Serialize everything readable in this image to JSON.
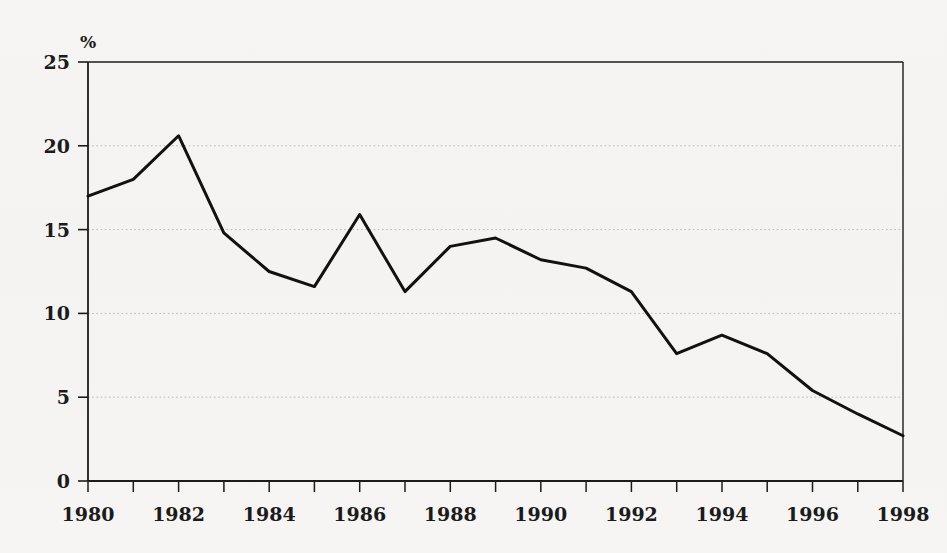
{
  "chart_data": {
    "type": "line",
    "title": "",
    "subtitle": "",
    "xlabel": "",
    "ylabel": "%",
    "unit_label": "%",
    "x": [
      1980,
      1981,
      1982,
      1983,
      1984,
      1985,
      1986,
      1987,
      1988,
      1989,
      1990,
      1991,
      1992,
      1993,
      1994,
      1995,
      1996,
      1997,
      1998
    ],
    "values": [
      17.0,
      18.0,
      20.6,
      14.8,
      12.5,
      11.6,
      15.9,
      11.3,
      14.0,
      14.5,
      13.2,
      12.7,
      11.3,
      7.6,
      8.7,
      7.6,
      5.4,
      4.0,
      2.7
    ],
    "series": [
      {
        "name": "",
        "values": [
          17.0,
          18.0,
          20.6,
          14.8,
          12.5,
          11.6,
          15.9,
          11.3,
          14.0,
          14.5,
          13.2,
          12.7,
          11.3,
          7.6,
          8.7,
          7.6,
          5.4,
          4.0,
          2.7
        ]
      }
    ],
    "xlim": [
      1980,
      1998
    ],
    "ylim": [
      0,
      25
    ],
    "y_ticks": [
      0,
      5,
      10,
      15,
      20,
      25
    ],
    "y_tick_labels": [
      "0",
      "5",
      "10",
      "15",
      "20",
      "25"
    ],
    "x_ticks": [
      1980,
      1981,
      1982,
      1983,
      1984,
      1985,
      1986,
      1987,
      1988,
      1989,
      1990,
      1991,
      1992,
      1993,
      1994,
      1995,
      1996,
      1997,
      1998
    ],
    "x_tick_labels_shown": [
      "1980",
      "1982",
      "1984",
      "1986",
      "1988",
      "1990",
      "1992",
      "1994",
      "1996",
      "1998"
    ],
    "x_labelled_ticks": [
      1980,
      1982,
      1984,
      1986,
      1988,
      1990,
      1992,
      1994,
      1996,
      1998
    ],
    "grid": {
      "horizontal": true,
      "vertical": false,
      "style": "dotted",
      "at": [
        5,
        10,
        15,
        20
      ]
    },
    "legend": {
      "present": false,
      "position": "none",
      "entries": []
    },
    "annotations": [],
    "colors": {
      "background": "#f5f4f2",
      "line": "#111111",
      "axis": "#1b1b1b",
      "grid": "#b9b9b9",
      "text": "#1b1b1b"
    },
    "line_width_px": 3
  }
}
